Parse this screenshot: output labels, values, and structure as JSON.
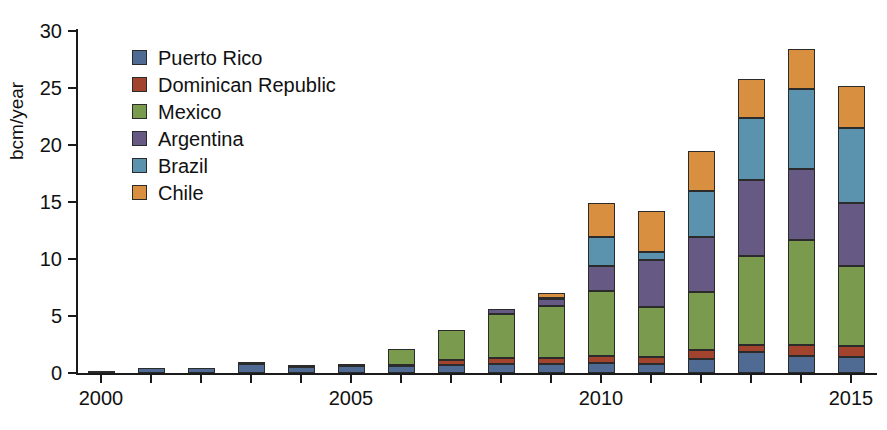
{
  "chart_data": {
    "type": "bar",
    "stacked": true,
    "title": "",
    "xlabel": "",
    "ylabel": "bcm/year",
    "ylim": [
      0,
      30
    ],
    "yticks": [
      0,
      5,
      10,
      15,
      20,
      25,
      30
    ],
    "ytick_labels": [
      "0",
      "5",
      "10",
      "15",
      "20",
      "25",
      "30"
    ],
    "xlim": [
      1999.5,
      2015.5
    ],
    "categories": [
      2000,
      2001,
      2002,
      2003,
      2004,
      2005,
      2006,
      2007,
      2008,
      2009,
      2010,
      2011,
      2012,
      2013,
      2014,
      2015
    ],
    "xtick_labels_shown": [
      "2000",
      "2005",
      "2010",
      "2015"
    ],
    "xticks_all": [
      2000,
      2001,
      2002,
      2003,
      2004,
      2005,
      2006,
      2007,
      2008,
      2009,
      2010,
      2011,
      2012,
      2013,
      2014,
      2015
    ],
    "grid": false,
    "legend_position": "upper left",
    "series": [
      {
        "name": "Puerto Rico",
        "color": "#4f6b94",
        "values": [
          0.2,
          0.45,
          0.4,
          0.75,
          0.55,
          0.6,
          0.6,
          0.7,
          0.8,
          0.8,
          0.9,
          0.8,
          1.2,
          1.8,
          1.5,
          1.4
        ]
      },
      {
        "name": "Dominican Republic",
        "color": "#a2432e",
        "values": [
          0.0,
          0.0,
          0.0,
          0.15,
          0.1,
          0.1,
          0.1,
          0.4,
          0.5,
          0.5,
          0.6,
          0.6,
          0.8,
          0.7,
          1.0,
          1.0
        ]
      },
      {
        "name": "Mexico",
        "color": "#7a9b4e",
        "values": [
          0.0,
          0.0,
          0.0,
          0.0,
          0.0,
          0.0,
          1.4,
          2.7,
          3.9,
          4.6,
          5.7,
          4.4,
          5.1,
          7.8,
          9.2,
          7.0
        ]
      },
      {
        "name": "Argentina",
        "color": "#665a85",
        "values": [
          0.0,
          0.0,
          0.0,
          0.0,
          0.0,
          0.0,
          0.0,
          0.0,
          0.4,
          0.6,
          2.2,
          4.1,
          4.8,
          6.6,
          6.2,
          5.5
        ]
      },
      {
        "name": "Brazil",
        "color": "#5b92ad",
        "values": [
          0.0,
          0.0,
          0.0,
          0.0,
          0.0,
          0.0,
          0.0,
          0.0,
          0.0,
          0.1,
          2.5,
          0.7,
          4.1,
          5.5,
          7.0,
          6.6
        ]
      },
      {
        "name": "Chile",
        "color": "#d89040",
        "values": [
          0.0,
          0.0,
          0.0,
          0.0,
          0.0,
          0.0,
          0.0,
          0.0,
          0.0,
          0.4,
          3.0,
          3.6,
          3.5,
          3.4,
          3.5,
          3.7
        ]
      }
    ],
    "totals": [
      0.2,
      0.45,
      0.4,
      0.9,
      0.65,
      0.7,
      2.1,
      3.8,
      5.6,
      7.0,
      14.9,
      14.2,
      19.5,
      25.8,
      28.4,
      25.2
    ]
  },
  "legend": {
    "items": [
      {
        "label": "Puerto Rico",
        "color": "#4f6b94"
      },
      {
        "label": "Dominican Republic",
        "color": "#a2432e"
      },
      {
        "label": "Mexico",
        "color": "#7a9b4e"
      },
      {
        "label": "Argentina",
        "color": "#665a85"
      },
      {
        "label": "Brazil",
        "color": "#5b92ad"
      },
      {
        "label": "Chile",
        "color": "#d89040"
      }
    ]
  },
  "axes": {
    "y_axis_label": "bcm/year"
  }
}
